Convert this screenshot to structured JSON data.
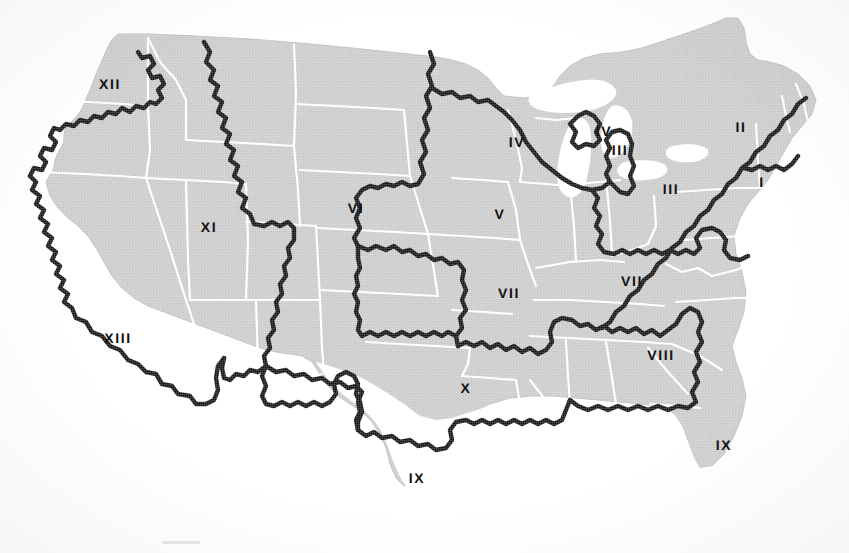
{
  "figure": {
    "kind": "map",
    "caption": "",
    "background_color": "#ffffff"
  },
  "map": {
    "land_fill": "#c9c9c9",
    "land_fill_light": "#d2d2d2",
    "water_fill": "#ffffff",
    "state_border_color": "#ffffff",
    "state_border_width": 2.2,
    "region_border_color": "#101010",
    "region_border_width": 4.4,
    "coast_outline_color": "#bdbdbd",
    "label_color": "#121212",
    "label_font_size": 14,
    "projection_note": "scanned halftone line map"
  },
  "regions": [
    {
      "id": "I",
      "label": "I",
      "x": 762,
      "y": 182,
      "area": "Northeast seaboard"
    },
    {
      "id": "II",
      "label": "II",
      "x": 741,
      "y": 127,
      "area": "Upper New England / New York"
    },
    {
      "id": "III-a",
      "label": "III",
      "x": 620,
      "y": 150,
      "area": "Lower Michigan"
    },
    {
      "id": "III-b",
      "label": "III",
      "x": 671,
      "y": 189,
      "area": "Ohio / Pennsylvania"
    },
    {
      "id": "IV-a",
      "label": "IV",
      "x": 517,
      "y": 142,
      "area": "Wisconsin / Minnesota"
    },
    {
      "id": "IV-b",
      "label": "IV",
      "x": 604,
      "y": 131,
      "area": "Upper Michigan"
    },
    {
      "id": "V",
      "label": "V",
      "x": 500,
      "y": 214,
      "area": "Iowa / Illinois"
    },
    {
      "id": "VI",
      "label": "VI",
      "x": 356,
      "y": 208,
      "area": "Nebraska / Dakotas"
    },
    {
      "id": "VII-a",
      "label": "VII",
      "x": 509,
      "y": 293,
      "area": "Missouri / Kentucky"
    },
    {
      "id": "VII-b",
      "label": "VII",
      "x": 632,
      "y": 281,
      "area": "Kentucky / Tennessee / Virginia"
    },
    {
      "id": "VIII",
      "label": "VIII",
      "x": 661,
      "y": 355,
      "area": "Georgia / Carolinas"
    },
    {
      "id": "IX-a",
      "label": "IX",
      "x": 417,
      "y": 478,
      "area": "South Texas"
    },
    {
      "id": "IX-b",
      "label": "IX",
      "x": 724,
      "y": 445,
      "area": "Florida"
    },
    {
      "id": "X",
      "label": "X",
      "x": 466,
      "y": 388,
      "area": "Oklahoma / Arkansas / Texas"
    },
    {
      "id": "XI",
      "label": "XI",
      "x": 209,
      "y": 227,
      "area": "Intermountain West"
    },
    {
      "id": "XII",
      "label": "XII",
      "x": 110,
      "y": 84,
      "area": "Pacific Northwest"
    },
    {
      "id": "XIII",
      "label": "XIII",
      "x": 118,
      "y": 338,
      "area": "Southwest / California"
    }
  ]
}
